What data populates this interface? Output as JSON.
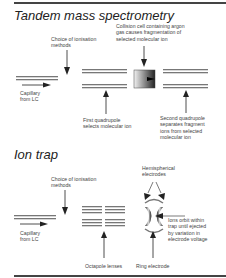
{
  "sections": {
    "tandem": {
      "title": "Tandem mass spectrometry",
      "labels": {
        "collision_cell": "Collision cell containing argon\ngas causes fragmentation of\nselected molecular ion",
        "ionisation": "Choice of ionisation\nmethods",
        "capillary": "Capillary\nfrom LC",
        "first_quad": "First quadrupole\nselects molecular ion",
        "second_quad": "Second quadrupole\nseparates fragment\nions from selected\nmolecular ion"
      }
    },
    "iontrap": {
      "title": "Ion trap",
      "labels": {
        "ionisation": "Choice of ionisation\nmethods",
        "hemispherical": "Hemispherical\nelectrodes",
        "capillary": "Capillary\nfrom LC",
        "orbit": "Ions orbit within\ntrap until ejected\nby variation in\nelectrode voltage",
        "octapole": "Octapole lenses",
        "ring": "Ring electrode"
      }
    }
  },
  "colors": {
    "rule": "#444444",
    "rod": "#777777",
    "arrow": "#222222"
  }
}
